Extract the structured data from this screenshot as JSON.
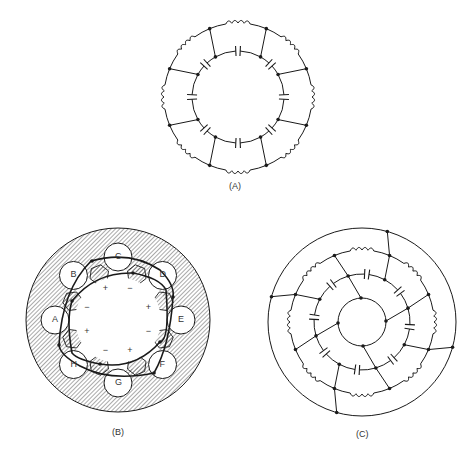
{
  "figure": {
    "panels": [
      {
        "id": "A",
        "caption": "(A)",
        "description": "Ring network: outer inductor ring and inner capacitor ring connected by 8 radial links"
      },
      {
        "id": "B",
        "caption": "(B)",
        "description": "Machine cross-section with 8 stator slots labeled A–H, rotor poles with +/− polarity, and two winding loops"
      },
      {
        "id": "C",
        "caption": "(C)",
        "description": "Concentric ring network: outer ring, inductor ring, capacitor ring, inner ring with radial connections"
      }
    ],
    "slot_labels": [
      "A",
      "B",
      "C",
      "D",
      "E",
      "F",
      "G",
      "H"
    ],
    "polarity_marks": [
      "+",
      "−",
      "+",
      "−",
      "+",
      "−",
      "+",
      "−"
    ]
  },
  "colors": {
    "line": "#1a1a1a",
    "hatch": "#555555",
    "background": "#ffffff"
  }
}
